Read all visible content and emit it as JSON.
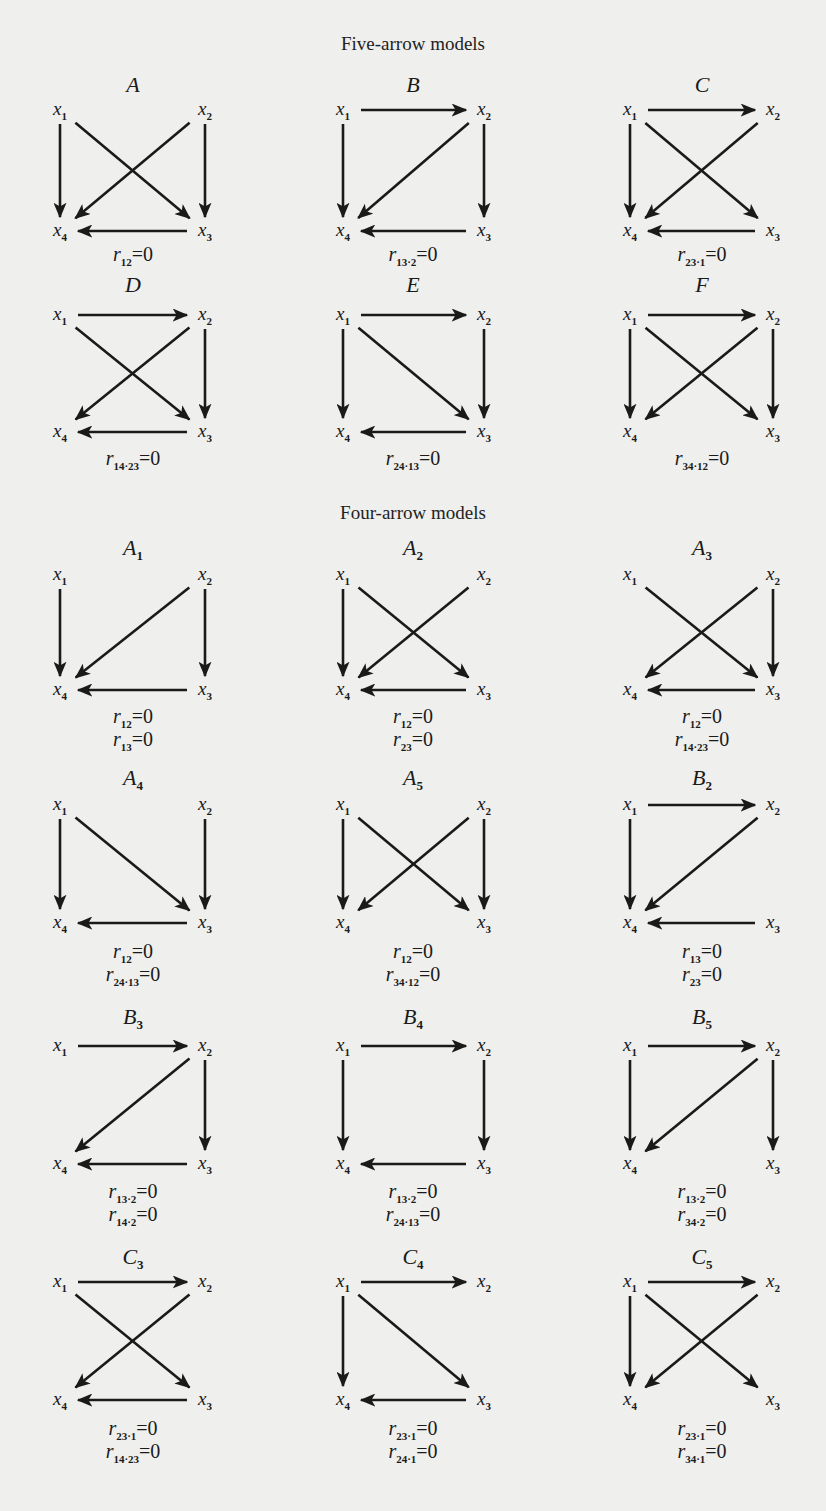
{
  "figure": {
    "background": "#efefed",
    "ink": "#1a1a1a",
    "sections": [
      {
        "title": "Five-arrow models",
        "title_y": 33
      },
      {
        "title": "Four-arrow models",
        "title_y": 502
      }
    ],
    "columns": [
      {
        "left": 60,
        "right": 205,
        "label_x": 133
      },
      {
        "left": 343,
        "right": 484,
        "label_x": 413
      },
      {
        "left": 630,
        "right": 773,
        "label_x": 702
      }
    ],
    "panels": [
      {
        "id": "A",
        "label": "A",
        "sub": "",
        "col": 0,
        "label_y": 72,
        "top": 110,
        "bottom": 231,
        "rel_y": 243,
        "edges": [
          [
            1,
            4
          ],
          [
            1,
            3
          ],
          [
            2,
            4
          ],
          [
            2,
            3
          ],
          [
            3,
            4
          ]
        ],
        "relations": [
          {
            "sub": "12",
            "eq": "=0"
          }
        ]
      },
      {
        "id": "B",
        "label": "B",
        "sub": "",
        "col": 1,
        "label_y": 72,
        "top": 110,
        "bottom": 231,
        "rel_y": 243,
        "edges": [
          [
            1,
            2
          ],
          [
            1,
            4
          ],
          [
            2,
            4
          ],
          [
            2,
            3
          ],
          [
            3,
            4
          ]
        ],
        "relations": [
          {
            "sub": "13·2",
            "eq": "=0"
          }
        ]
      },
      {
        "id": "C",
        "label": "C",
        "sub": "",
        "col": 2,
        "label_y": 72,
        "top": 110,
        "bottom": 231,
        "rel_y": 243,
        "edges": [
          [
            1,
            2
          ],
          [
            1,
            4
          ],
          [
            1,
            3
          ],
          [
            2,
            4
          ],
          [
            3,
            4
          ]
        ],
        "relations": [
          {
            "sub": "23·1",
            "eq": "=0"
          }
        ]
      },
      {
        "id": "D",
        "label": "D",
        "sub": "",
        "col": 0,
        "label_y": 272,
        "top": 315,
        "bottom": 432,
        "rel_y": 447,
        "edges": [
          [
            1,
            2
          ],
          [
            1,
            3
          ],
          [
            2,
            4
          ],
          [
            2,
            3
          ],
          [
            3,
            4
          ]
        ],
        "relations": [
          {
            "sub": "14·23",
            "eq": "=0"
          }
        ]
      },
      {
        "id": "E",
        "label": "E",
        "sub": "",
        "col": 1,
        "label_y": 272,
        "top": 315,
        "bottom": 432,
        "rel_y": 447,
        "edges": [
          [
            1,
            2
          ],
          [
            1,
            4
          ],
          [
            1,
            3
          ],
          [
            2,
            3
          ],
          [
            3,
            4
          ]
        ],
        "relations": [
          {
            "sub": "24·13",
            "eq": "=0"
          }
        ]
      },
      {
        "id": "F",
        "label": "F",
        "sub": "",
        "col": 2,
        "label_y": 272,
        "top": 315,
        "bottom": 432,
        "rel_y": 447,
        "edges": [
          [
            1,
            2
          ],
          [
            1,
            4
          ],
          [
            1,
            3
          ],
          [
            2,
            4
          ],
          [
            2,
            3
          ]
        ],
        "relations": [
          {
            "sub": "34·12",
            "eq": "=0"
          }
        ]
      },
      {
        "id": "A1",
        "label": "A",
        "sub": "1",
        "col": 0,
        "label_y": 535,
        "top": 575,
        "bottom": 690,
        "rel_y": 705,
        "edges": [
          [
            1,
            4
          ],
          [
            2,
            4
          ],
          [
            2,
            3
          ],
          [
            3,
            4
          ]
        ],
        "relations": [
          {
            "sub": "12",
            "eq": "=0"
          },
          {
            "sub": "13",
            "eq": "=0"
          }
        ]
      },
      {
        "id": "A2",
        "label": "A",
        "sub": "2",
        "col": 1,
        "label_y": 535,
        "top": 575,
        "bottom": 690,
        "rel_y": 705,
        "edges": [
          [
            1,
            4
          ],
          [
            1,
            3
          ],
          [
            2,
            4
          ],
          [
            3,
            4
          ]
        ],
        "relations": [
          {
            "sub": "12",
            "eq": "=0"
          },
          {
            "sub": "23",
            "eq": "=0"
          }
        ]
      },
      {
        "id": "A3",
        "label": "A",
        "sub": "3",
        "col": 2,
        "label_y": 535,
        "top": 575,
        "bottom": 690,
        "rel_y": 705,
        "edges": [
          [
            1,
            3
          ],
          [
            2,
            4
          ],
          [
            2,
            3
          ],
          [
            3,
            4
          ]
        ],
        "relations": [
          {
            "sub": "12",
            "eq": "=0"
          },
          {
            "sub": "14·23",
            "eq": "=0"
          }
        ]
      },
      {
        "id": "A4",
        "label": "A",
        "sub": "4",
        "col": 0,
        "label_y": 765,
        "top": 805,
        "bottom": 923,
        "rel_y": 940,
        "edges": [
          [
            1,
            4
          ],
          [
            1,
            3
          ],
          [
            2,
            3
          ],
          [
            3,
            4
          ]
        ],
        "relations": [
          {
            "sub": "12",
            "eq": "=0"
          },
          {
            "sub": "24·13",
            "eq": "=0"
          }
        ]
      },
      {
        "id": "A5",
        "label": "A",
        "sub": "5",
        "col": 1,
        "label_y": 765,
        "top": 805,
        "bottom": 923,
        "rel_y": 940,
        "edges": [
          [
            1,
            4
          ],
          [
            1,
            3
          ],
          [
            2,
            4
          ],
          [
            2,
            3
          ]
        ],
        "relations": [
          {
            "sub": "12",
            "eq": "=0"
          },
          {
            "sub": "34·12",
            "eq": "=0"
          }
        ]
      },
      {
        "id": "B2",
        "label": "B",
        "sub": "2",
        "col": 2,
        "label_y": 765,
        "top": 805,
        "bottom": 923,
        "rel_y": 940,
        "edges": [
          [
            1,
            2
          ],
          [
            1,
            4
          ],
          [
            2,
            4
          ],
          [
            3,
            4
          ]
        ],
        "relations": [
          {
            "sub": "13",
            "eq": "=0"
          },
          {
            "sub": "23",
            "eq": "=0"
          }
        ]
      },
      {
        "id": "B3",
        "label": "B",
        "sub": "3",
        "col": 0,
        "label_y": 1004,
        "top": 1046,
        "bottom": 1164,
        "rel_y": 1180,
        "edges": [
          [
            1,
            2
          ],
          [
            2,
            4
          ],
          [
            2,
            3
          ],
          [
            3,
            4
          ]
        ],
        "relations": [
          {
            "sub": "13·2",
            "eq": "=0"
          },
          {
            "sub": "14·2",
            "eq": "=0"
          }
        ]
      },
      {
        "id": "B4",
        "label": "B",
        "sub": "4",
        "col": 1,
        "label_y": 1004,
        "top": 1046,
        "bottom": 1164,
        "rel_y": 1180,
        "edges": [
          [
            1,
            2
          ],
          [
            1,
            4
          ],
          [
            2,
            3
          ],
          [
            3,
            4
          ]
        ],
        "relations": [
          {
            "sub": "13·2",
            "eq": "=0"
          },
          {
            "sub": "24·13",
            "eq": "=0"
          }
        ]
      },
      {
        "id": "B5",
        "label": "B",
        "sub": "5",
        "col": 2,
        "label_y": 1004,
        "top": 1046,
        "bottom": 1164,
        "rel_y": 1180,
        "edges": [
          [
            1,
            2
          ],
          [
            1,
            4
          ],
          [
            2,
            4
          ],
          [
            2,
            3
          ]
        ],
        "relations": [
          {
            "sub": "13·2",
            "eq": "=0"
          },
          {
            "sub": "34·2",
            "eq": "=0"
          }
        ]
      },
      {
        "id": "C3",
        "label": "C",
        "sub": "3",
        "col": 0,
        "label_y": 1244,
        "top": 1282,
        "bottom": 1400,
        "rel_y": 1417,
        "edges": [
          [
            1,
            2
          ],
          [
            1,
            3
          ],
          [
            2,
            4
          ],
          [
            3,
            4
          ]
        ],
        "relations": [
          {
            "sub": "23·1",
            "eq": "=0"
          },
          {
            "sub": "14·23",
            "eq": "=0"
          }
        ]
      },
      {
        "id": "C4",
        "label": "C",
        "sub": "4",
        "col": 1,
        "label_y": 1244,
        "top": 1282,
        "bottom": 1400,
        "rel_y": 1417,
        "edges": [
          [
            1,
            2
          ],
          [
            1,
            4
          ],
          [
            1,
            3
          ],
          [
            3,
            4
          ]
        ],
        "relations": [
          {
            "sub": "23·1",
            "eq": "=0"
          },
          {
            "sub": "24·1",
            "eq": "=0"
          }
        ]
      },
      {
        "id": "C5",
        "label": "C",
        "sub": "5",
        "col": 2,
        "label_y": 1244,
        "top": 1282,
        "bottom": 1400,
        "rel_y": 1417,
        "edges": [
          [
            1,
            2
          ],
          [
            1,
            4
          ],
          [
            1,
            3
          ],
          [
            2,
            4
          ]
        ],
        "relations": [
          {
            "sub": "23·1",
            "eq": "=0"
          },
          {
            "sub": "34·1",
            "eq": "=0"
          }
        ]
      }
    ],
    "node_names": {
      "1": "x",
      "2": "x",
      "3": "x",
      "4": "x"
    },
    "relation_symbol": "r"
  }
}
